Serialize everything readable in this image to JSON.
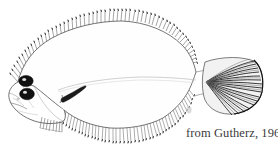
{
  "figure": {
    "kind": "scientific-line-drawing",
    "orientation": "head-left-tail-right",
    "background_color": "#ffffff",
    "ink_color": "#1a1a1a",
    "light_ink_color": "#8a8a8a",
    "parts": [
      {
        "name": "body-outline",
        "label": "Body outline"
      },
      {
        "name": "head",
        "label": "Head"
      },
      {
        "name": "eye-upper",
        "label": "Upper eye"
      },
      {
        "name": "eye-lower",
        "label": "Lower eye"
      },
      {
        "name": "mouth",
        "label": "Mouth"
      },
      {
        "name": "operculum",
        "label": "Opercle"
      },
      {
        "name": "dorsal-fin",
        "label": "Dorsal fin"
      },
      {
        "name": "anal-fin",
        "label": "Anal fin"
      },
      {
        "name": "pectoral-fin",
        "label": "Pectoral fin"
      },
      {
        "name": "pelvic-fin",
        "label": "Pelvic fin"
      },
      {
        "name": "caudal-fin",
        "label": "Caudal fin"
      },
      {
        "name": "lateral-line",
        "label": "Lateral line"
      }
    ],
    "counts": {
      "dorsal_fin_rays": 58,
      "anal_fin_rays": 44,
      "caudal_fin_rays": 26,
      "pelvic_fin_rays": 8,
      "eyes": 2
    }
  },
  "attribution": {
    "text": "from Gutherz, 1967",
    "author": "Gutherz",
    "year": "1967",
    "prefix": "from"
  }
}
